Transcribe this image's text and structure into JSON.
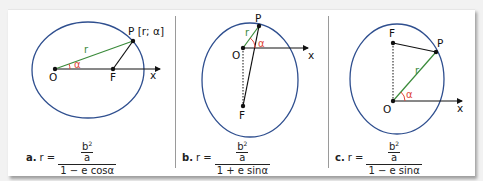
{
  "figure": {
    "panels": [
      {
        "id": "a",
        "labels": {
          "P": "P [r; α]",
          "O": "O",
          "F": "F",
          "x": "x",
          "r": "r",
          "alpha": "α"
        },
        "formula": {
          "tag": "a.",
          "lhs": "r =",
          "num_top": "b",
          "num_sup": "2",
          "num_bottom": "a",
          "denominator": "1 − e cosα"
        }
      },
      {
        "id": "b",
        "labels": {
          "P": "P",
          "O": "O",
          "F": "F",
          "x": "x",
          "r": "r",
          "alpha": "α"
        },
        "formula": {
          "tag": "b.",
          "lhs": "r =",
          "num_top": "b",
          "num_sup": "2",
          "num_bottom": "a",
          "denominator": "1 + e sinα"
        }
      },
      {
        "id": "c",
        "labels": {
          "P": "P",
          "O": "O",
          "F": "F",
          "x": "x",
          "r": "r",
          "alpha": "α"
        },
        "formula": {
          "tag": "c.",
          "lhs": "r =",
          "num_top": "b",
          "num_sup": "2",
          "num_bottom": "a",
          "denominator": "1 − e sinα"
        }
      }
    ],
    "colors": {
      "ellipse": "#2f4f8f",
      "radius": "#3a8a3a",
      "angle": "#e0463a",
      "line": "#111111",
      "divider": "#9a9a9a"
    }
  }
}
